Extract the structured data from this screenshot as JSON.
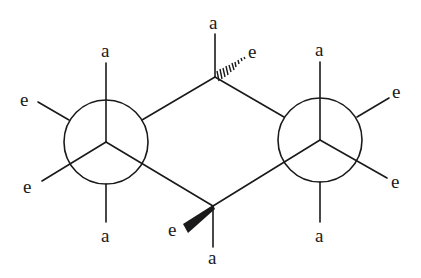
{
  "diagram": {
    "type": "newman-projection-chair",
    "color": "#1a1a1a",
    "background": "#ffffff",
    "labels": {
      "axial": "a",
      "equatorial": "e"
    },
    "left_newman": {
      "labels": [
        {
          "id": "ln-top",
          "text": "a"
        },
        {
          "id": "ln-upper-left",
          "text": "e"
        },
        {
          "id": "ln-lower-left",
          "text": "e"
        },
        {
          "id": "ln-bottom",
          "text": "a"
        }
      ]
    },
    "right_newman": {
      "labels": [
        {
          "id": "rn-top",
          "text": "a"
        },
        {
          "id": "rn-upper-right",
          "text": "e"
        },
        {
          "id": "rn-lower-right",
          "text": "e"
        },
        {
          "id": "rn-bottom",
          "text": "a"
        }
      ]
    },
    "top_carbon": {
      "labels": [
        {
          "id": "tc-axial",
          "text": "a"
        },
        {
          "id": "tc-equatorial",
          "text": "e",
          "bond": "hashed-wedge"
        }
      ]
    },
    "bottom_carbon": {
      "labels": [
        {
          "id": "bc-equatorial",
          "text": "e",
          "bond": "solid-wedge"
        },
        {
          "id": "bc-axial",
          "text": "a"
        }
      ]
    }
  }
}
